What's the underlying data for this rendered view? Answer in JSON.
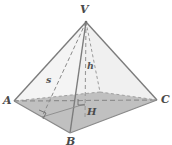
{
  "figure": {
    "name": "square-pyramid-geometry-diagram",
    "type": "geometry-solid-diagram",
    "background_color": "#ffffff",
    "base_fill_color": "#b4b4b4",
    "stroke_color": "#7a7a7a",
    "dashed_stroke_color": "#8c8c8c",
    "label_color": "#4a4a4a"
  },
  "labels": {
    "apex": "V",
    "left_vertex": "A",
    "right_vertex": "C",
    "front_vertex": "B",
    "center_point": "H",
    "slant_height": "s",
    "height": "h"
  },
  "geometry": {
    "apex": {
      "x": 86,
      "y": 22
    },
    "left_vertex": {
      "x": 14,
      "y": 101
    },
    "right_vertex": {
      "x": 157,
      "y": 100
    },
    "front_vertex": {
      "x": 70,
      "y": 133
    },
    "back_vertex": {
      "x": 100,
      "y": 92
    },
    "center_point": {
      "x": 85,
      "y": 104
    },
    "slant_foot": {
      "x": 42,
      "y": 117
    }
  },
  "annotations": {
    "height_is_dashed": true,
    "diagonal_ac_is_dashed": true,
    "back_edges_dashed": true,
    "right_angle_at_center": true,
    "right_angle_at_slant_foot": true
  }
}
